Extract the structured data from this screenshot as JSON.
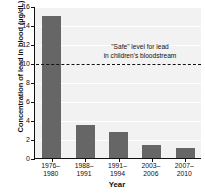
{
  "chart_data": {
    "type": "bar",
    "title": "",
    "xlabel": "Year",
    "ylabel": "Concentration of lead in blood (µg/dL)",
    "categories": [
      "1976–\n1980",
      "1988–\n1991",
      "1991–\n1994",
      "2003–\n2006",
      "2007–\n2010"
    ],
    "category_lines": [
      [
        "1976–",
        "1980"
      ],
      [
        "1988–",
        "1991"
      ],
      [
        "1991–",
        "1994"
      ],
      [
        "2003–",
        "2006"
      ],
      [
        "2007–",
        "2010"
      ]
    ],
    "values": [
      15.0,
      3.5,
      2.7,
      1.4,
      1.1
    ],
    "ylim": [
      0,
      16
    ],
    "ytick_values": [
      0,
      2,
      4,
      6,
      8,
      10,
      12,
      14,
      16
    ],
    "ytick_labels": [
      "0",
      "2",
      "4",
      "6",
      "8",
      "10",
      "12",
      "14",
      "16"
    ],
    "grid": true,
    "legend": "none",
    "bar_color": "#666666",
    "plot_background": "#f2f2f2",
    "gridline_color": "#ffffff",
    "axis_color": "#111111",
    "annotations": [
      {
        "name": "safe-level-threshold",
        "value": 10,
        "style": "dashed",
        "color": "#111111",
        "lines": [
          "\"Safe\" level for lead",
          "in children's bloodstream"
        ]
      }
    ]
  }
}
